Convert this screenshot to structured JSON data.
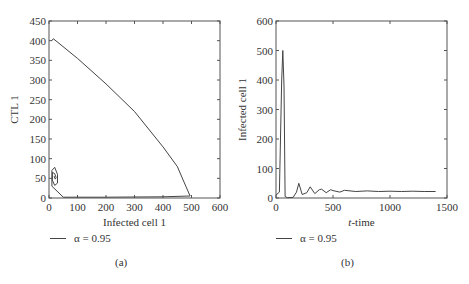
{
  "top_fragment": "( ) (a)  ( ) (b)",
  "chart_data": [
    {
      "id": "a",
      "type": "line",
      "title": "",
      "xlabel": "Infected cell 1",
      "ylabel": "CTL 1",
      "xlim": [
        0,
        600
      ],
      "ylim": [
        0,
        450
      ],
      "xticks": [
        0,
        100,
        200,
        300,
        400,
        500,
        600
      ],
      "yticks": [
        0,
        50,
        100,
        150,
        200,
        250,
        300,
        350,
        400,
        450
      ],
      "grid": false,
      "legend": {
        "position": "below",
        "entries": [
          "α = 0.95"
        ]
      },
      "series": [
        {
          "name": "α = 0.95",
          "description": "phase trajectory: starts near (10,405), descends linearly to ~(495,5), runs back along x-axis, spirals into focus near (20,55)",
          "x": [
            10,
            15,
            100,
            200,
            300,
            400,
            450,
            480,
            495,
            400,
            200,
            50,
            10,
            10,
            20,
            30,
            30,
            20,
            12,
            12,
            20,
            25,
            22,
            18,
            20
          ],
          "y": [
            400,
            405,
            355,
            290,
            220,
            130,
            80,
            30,
            5,
            3,
            2,
            2,
            30,
            70,
            78,
            60,
            38,
            32,
            45,
            65,
            62,
            52,
            48,
            55,
            55
          ]
        }
      ],
      "caption": "(a)"
    },
    {
      "id": "b",
      "type": "line",
      "title": "",
      "xlabel": "t-time",
      "ylabel": "Infected cell 1",
      "xlim": [
        0,
        1500
      ],
      "ylim": [
        0,
        600
      ],
      "xticks": [
        0,
        500,
        1000,
        1500
      ],
      "yticks": [
        0,
        100,
        200,
        300,
        400,
        500,
        600
      ],
      "grid": false,
      "legend": {
        "position": "below",
        "entries": [
          "α = 0.95"
        ]
      },
      "series": [
        {
          "name": "α = 0.95",
          "description": "sharp spike to ~500 near t≈60, then damped oscillations settling near 22",
          "x": [
            0,
            30,
            50,
            60,
            70,
            80,
            100,
            150,
            180,
            200,
            230,
            270,
            300,
            340,
            380,
            400,
            440,
            480,
            500,
            560,
            600,
            700,
            800,
            900,
            1000,
            1100,
            1200,
            1300,
            1400
          ],
          "y": [
            10,
            20,
            400,
            500,
            380,
            5,
            1,
            2,
            20,
            50,
            12,
            18,
            38,
            15,
            28,
            30,
            18,
            28,
            25,
            20,
            26,
            22,
            24,
            22,
            23,
            22,
            23,
            22,
            22
          ]
        }
      ],
      "caption": "(b)"
    }
  ],
  "legend_label": "α = 0.95",
  "captions": {
    "a": "(a)",
    "b": "(b)"
  },
  "axes": {
    "a": {
      "xlabel": "Infected cell 1",
      "ylabel": "CTL 1"
    },
    "b": {
      "xlabel": "t-time",
      "ylabel": "Infected cell 1"
    }
  },
  "line_color": "#444444"
}
